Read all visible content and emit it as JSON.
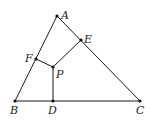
{
  "diagram": {
    "type": "geometry",
    "points": {
      "A": {
        "x": 57,
        "y": 16,
        "label": "A",
        "lx": 61,
        "ly": 19
      },
      "B": {
        "x": 15,
        "y": 101,
        "label": "B",
        "lx": 10,
        "ly": 114
      },
      "C": {
        "x": 140,
        "y": 101,
        "label": "C",
        "lx": 136,
        "ly": 114
      },
      "D": {
        "x": 53,
        "y": 101,
        "label": "D",
        "lx": 48,
        "ly": 114
      },
      "E": {
        "x": 81,
        "y": 40,
        "label": "E",
        "lx": 84,
        "ly": 43
      },
      "F": {
        "x": 36,
        "y": 59,
        "label": "F",
        "lx": 25,
        "ly": 62
      },
      "P": {
        "x": 53,
        "y": 67,
        "label": "P",
        "lx": 56,
        "ly": 78
      }
    },
    "segments": [
      [
        "A",
        "B"
      ],
      [
        "B",
        "C"
      ],
      [
        "C",
        "A"
      ],
      [
        "P",
        "D"
      ],
      [
        "P",
        "E"
      ],
      [
        "P",
        "F"
      ]
    ],
    "colors": {
      "line": "#1a1a1a",
      "point": "#111111",
      "label": "#222222",
      "background": "#ffffff"
    }
  }
}
